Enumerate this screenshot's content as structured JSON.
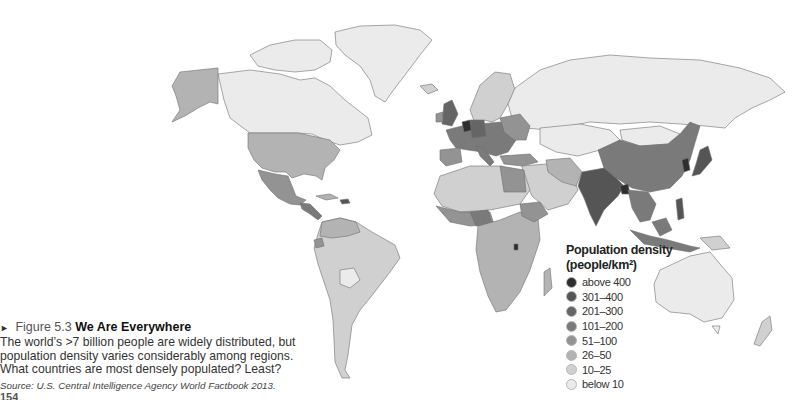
{
  "figure": {
    "arrow_glyph": "►",
    "number": "Figure 5.3",
    "title": "We Are Everywhere",
    "caption": "The world’s >7 billion people are widely distributed, but population density varies considerably among regions. What countries are most densely populated? Least?",
    "source": "Source: U.S. Central Intelligence Agency World Factbook 2013.",
    "page_number": "154"
  },
  "legend": {
    "title_line1": "Population density",
    "title_line2": "(people/km²)",
    "items": [
      {
        "label": "above 400",
        "color": "#2e2e2e"
      },
      {
        "label": "301–400",
        "color": "#555555"
      },
      {
        "label": "201–300",
        "color": "#656565"
      },
      {
        "label": "101–200",
        "color": "#7a7a7a"
      },
      {
        "label": "51–100",
        "color": "#939393"
      },
      {
        "label": "26–50",
        "color": "#b3b3b3"
      },
      {
        "label": "10–25",
        "color": "#d0d0d0"
      },
      {
        "label": "below 10",
        "color": "#ebebeb"
      }
    ]
  },
  "chart_data": {
    "type": "choropleth-map",
    "title": "Population density (people/km²)",
    "legend_position": "lower-right (over Indian Ocean)",
    "classes": [
      "above 400",
      "301–400",
      "201–300",
      "101–200",
      "51–100",
      "26–50",
      "10–25",
      "below 10"
    ],
    "regions": [
      {
        "region": "Canada",
        "class": "below 10"
      },
      {
        "region": "Greenland",
        "class": "below 10"
      },
      {
        "region": "Alaska / United States",
        "class": "26–50"
      },
      {
        "region": "Mexico",
        "class": "51–100"
      },
      {
        "region": "Central America",
        "class": "51–100"
      },
      {
        "region": "Haiti / Dominican Rep.",
        "class": "301–400"
      },
      {
        "region": "Brazil",
        "class": "10–25"
      },
      {
        "region": "Argentina",
        "class": "10–25"
      },
      {
        "region": "Bolivia",
        "class": "below 10"
      },
      {
        "region": "Colombia / Venezuela",
        "class": "26–50"
      },
      {
        "region": "Ecuador",
        "class": "51–100"
      },
      {
        "region": "Russia",
        "class": "below 10"
      },
      {
        "region": "Western Europe",
        "class": "101–200"
      },
      {
        "region": "Netherlands / Belgium",
        "class": "above 400"
      },
      {
        "region": "United Kingdom / Germany",
        "class": "201–300"
      },
      {
        "region": "Scandinavia",
        "class": "10–25"
      },
      {
        "region": "Kazakhstan / Mongolia",
        "class": "below 10"
      },
      {
        "region": "China",
        "class": "101–200"
      },
      {
        "region": "India",
        "class": "301–400"
      },
      {
        "region": "Bangladesh",
        "class": "above 400"
      },
      {
        "region": "South Korea",
        "class": "above 400"
      },
      {
        "region": "Japan",
        "class": "301–400"
      },
      {
        "region": "Southeast Asia",
        "class": "101–200"
      },
      {
        "region": "North Africa (Algeria, Libya)",
        "class": "10–25"
      },
      {
        "region": "Egypt",
        "class": "51–100"
      },
      {
        "region": "Nigeria",
        "class": "101–200"
      },
      {
        "region": "Ethiopia",
        "class": "51–100"
      },
      {
        "region": "Central / Southern Africa",
        "class": "26–50"
      },
      {
        "region": "Rwanda / Burundi",
        "class": "above 400"
      },
      {
        "region": "Australia",
        "class": "below 10"
      },
      {
        "region": "New Zealand",
        "class": "10–25"
      },
      {
        "region": "Papua New Guinea",
        "class": "10–25"
      },
      {
        "region": "Indonesia",
        "class": "101–200"
      },
      {
        "region": "Philippines",
        "class": "301–400"
      }
    ]
  }
}
